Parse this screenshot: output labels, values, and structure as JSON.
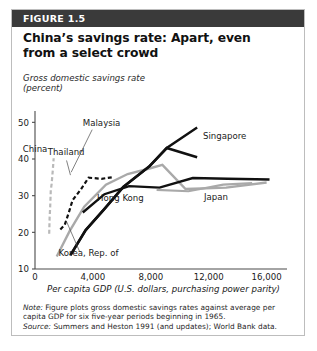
{
  "figure": {
    "header_label": "FIGURE 1.5",
    "title": "China’s savings rate: Apart, even from a select crowd",
    "y_axis_title_line1": "Gross domestic savings rate",
    "y_axis_title_line2": "(percent)",
    "note_label": "Note:",
    "note_text": " Figure plots gross domestic savings rates against average per capita GDP for six five-year periods beginning in 1965.",
    "source_label": "Source:",
    "source_text": " Summers and Heston 1991 (and updates); World Bank data."
  },
  "colors": {
    "header_band": "#3a3a3a",
    "header_text": "#ffffff",
    "card_border": "#bdbdbd",
    "black_series": "#111111",
    "gray_series": "#a9a9a9",
    "china_series": "#b9b9b9",
    "axis": "#4a4a4a",
    "text": "#1a1a1a"
  },
  "chart_data": {
    "type": "line",
    "title": "China’s savings rate: Apart, even from a select crowd",
    "xlabel": "Per capita GDP (U.S. dollars, purchasing power parity)",
    "ylabel": "Gross domestic savings rate (percent)",
    "xlim": [
      0,
      17200
    ],
    "ylim": [
      10,
      52
    ],
    "xticks": [
      0,
      4000,
      8000,
      12000,
      16000
    ],
    "xtick_labels": [
      "0",
      "4,000",
      "8,000",
      "12,000",
      "16,000"
    ],
    "yticks": [
      10,
      20,
      30,
      40,
      50
    ],
    "ytick_labels": [
      "10",
      "20",
      "30",
      "40",
      "50"
    ],
    "grid": false,
    "legend": "inline-labels",
    "series": [
      {
        "name": "China",
        "style": "dashed",
        "color": "#b9b9b9",
        "width": 2.2,
        "label_x": 6,
        "label_y": 41.8,
        "x": [
          980,
          1010,
          1050,
          1090,
          1150,
          1230,
          1290
        ],
        "y": [
          19.6,
          24.0,
          27.0,
          31.5,
          33.2,
          37.0,
          40.2
        ]
      },
      {
        "name": "Thailand",
        "style": "dashed",
        "color": "#111111",
        "width": 2.2,
        "label_x": 2150,
        "label_y": 41.0,
        "x": [
          1750,
          2050,
          2350,
          2600,
          3150,
          3700,
          4600,
          5300
        ],
        "y": [
          20.8,
          22.0,
          25.6,
          28.8,
          31.6,
          34.9,
          34.6,
          35.0
        ]
      },
      {
        "name": "Malaysia",
        "style": "solid",
        "color": "#a9a9a9",
        "width": 2.4,
        "label_x": 4600,
        "label_y": 49.0,
        "x": [
          1500,
          2400,
          3400,
          4900,
          6400,
          7900,
          8800,
          10400,
          13200,
          16000
        ],
        "y": [
          13.4,
          20.4,
          27.0,
          33.0,
          35.9,
          37.4,
          38.4,
          31.8,
          32.2,
          33.6
        ]
      },
      {
        "name": "Singapore",
        "style": "solid",
        "color": "#111111",
        "width": 2.6,
        "label_x": 13100,
        "label_y": 45.4,
        "x": [
          2450,
          3500,
          4800,
          6100,
          7900,
          9100,
          11200
        ],
        "y": [
          13.8,
          20.6,
          26.4,
          32.4,
          38.0,
          43.0,
          40.5
        ]
      },
      {
        "name": "Hong Kong",
        "style": "solid",
        "color": "#111111",
        "width": 2.4,
        "label_x": 5900,
        "label_y": 28.6,
        "x": [
          3300,
          4800,
          6500,
          8600,
          10900,
          13300,
          16200
        ],
        "y": [
          25.4,
          30.4,
          32.6,
          32.2,
          34.8,
          34.6,
          34.4
        ]
      },
      {
        "name": "Japan",
        "style": "solid",
        "color": "#a9a9a9",
        "width": 2.2,
        "label_x": 12500,
        "label_y": 28.8,
        "x": [
          8400,
          10600,
          13000,
          15000
        ],
        "y": [
          31.6,
          31.2,
          33.0,
          33.4
        ]
      },
      {
        "name": "Korea, Rep. of",
        "style": "solid",
        "color": "#111111",
        "width": 2.4,
        "label_x": 3700,
        "label_y": 13.6,
        "x": [
          2450,
          3500,
          4800,
          6100,
          7900,
          9100,
          11200
        ],
        "y": [
          13.8,
          20.6,
          26.4,
          32.4,
          38.0,
          43.0,
          48.6
        ]
      }
    ]
  }
}
